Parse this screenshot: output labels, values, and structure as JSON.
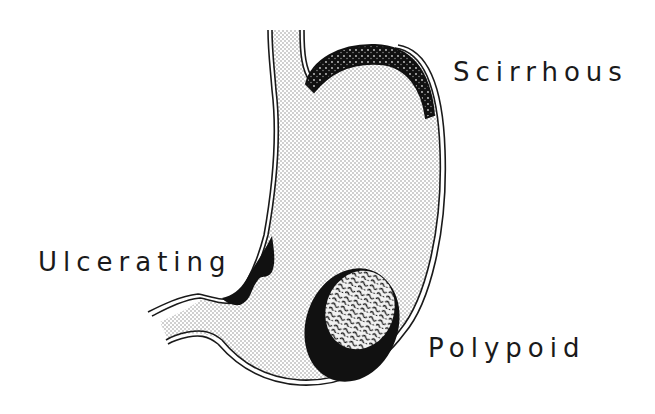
{
  "figure": {
    "colors": {
      "background": "#ffffff",
      "ink": "#1a1a1a",
      "stipple": "#8a8a8a",
      "lesion": "#111111"
    }
  },
  "labels": {
    "scirrhous": "Scirrhous",
    "ulcerating": "Ulcerating",
    "polypoid": "Polypoid"
  }
}
